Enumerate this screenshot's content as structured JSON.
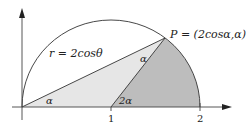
{
  "diagram": {
    "curve_label": "r = 2cosθ",
    "point_label": "P = (2cosα,α)",
    "angle_origin": "α",
    "angle_at_P": "α",
    "angle_center": "2α",
    "x_ticks": [
      "1",
      "2"
    ],
    "colors": {
      "light_triangle": "#e6e6e6",
      "dark_sector": "#bdbdbd",
      "stroke": "#333333"
    }
  }
}
